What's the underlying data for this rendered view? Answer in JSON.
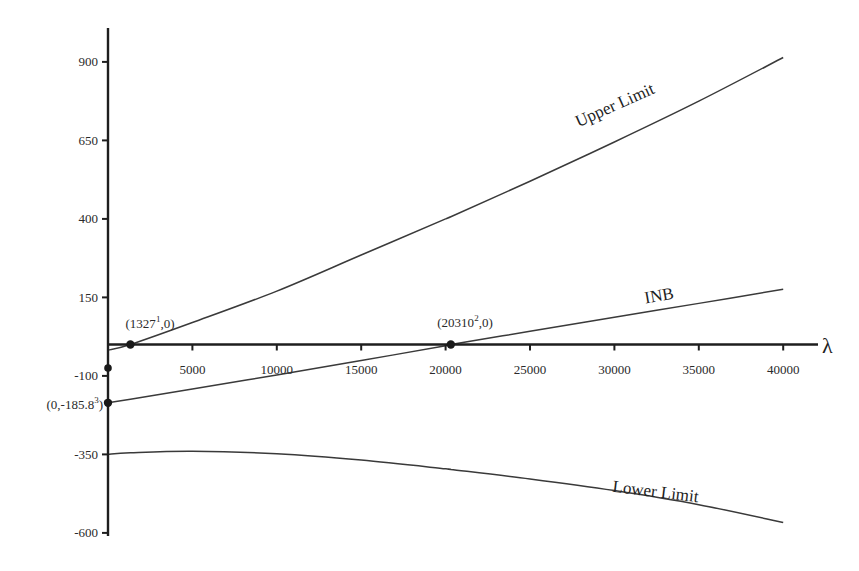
{
  "chart_data": {
    "type": "line",
    "title": "",
    "xlabel": "λ",
    "ylabel": "",
    "xlim": [
      0,
      42000
    ],
    "ylim": [
      -600,
      950
    ],
    "grid": false,
    "legend": "none (inline curve labels)",
    "x_ticks": [
      5000,
      10000,
      15000,
      20000,
      25000,
      30000,
      35000,
      40000
    ],
    "x_tick_labels": [
      "5000",
      "10000",
      "15000",
      "20000",
      "25000",
      "30000",
      "35000",
      "40000"
    ],
    "y_ticks": [
      900,
      650,
      400,
      150,
      -100,
      -350,
      -600
    ],
    "y_tick_labels": [
      "900",
      "650",
      "400",
      "150",
      "-100",
      "-350",
      "-600"
    ],
    "x": [
      0,
      1327,
      5000,
      10000,
      15000,
      20000,
      20310,
      25000,
      30000,
      35000,
      40000
    ],
    "series": [
      {
        "name": "Upper Limit",
        "label": "Upper Limit",
        "values": [
          -18,
          0,
          70,
          170,
          285,
          400,
          407,
          520,
          645,
          775,
          914
        ]
      },
      {
        "name": "INB",
        "label": "INB",
        "values": [
          -185.8,
          -174,
          -142,
          -97,
          -51,
          -4,
          0,
          42,
          87,
          131,
          176
        ]
      },
      {
        "name": "Lower Limit",
        "label": "Lower Limit",
        "values": [
          -350,
          -345,
          -340,
          -348,
          -368,
          -396,
          -398,
          -428,
          -465,
          -510,
          -567
        ]
      }
    ],
    "annotations": [
      {
        "text": "(1327¹,0)",
        "base": "(1327",
        "sup": "1",
        "tail": ",0)",
        "x": 1327,
        "y": 0
      },
      {
        "text": "(20310²,0)",
        "base": "(20310",
        "sup": "2",
        "tail": ",0)",
        "x": 20310,
        "y": 0
      },
      {
        "text": "(0,-185.8³)",
        "base": "(0,-185.8",
        "sup": "3",
        "tail": ")",
        "x": 0,
        "y": -185.8
      }
    ],
    "extra_markers": [
      {
        "x": 0,
        "y": -75
      }
    ]
  },
  "colors": {
    "axis": "#1e1e1e",
    "curve": "#3a3a3a",
    "marker": "#1a1a1a",
    "background": "#ffffff"
  }
}
